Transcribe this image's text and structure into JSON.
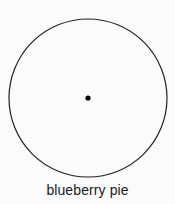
{
  "figure": {
    "caption": "blueberry pie",
    "background_color": "#fbfbfb",
    "stroke_color": "#222222",
    "fill_color": "#ffffff",
    "center_dot_color": "#000000"
  },
  "chart_data": {
    "type": "diagram",
    "title": "blueberry pie",
    "shape": "circle",
    "elements": [
      {
        "name": "circle-outline",
        "shape": "circle",
        "center_x": 88,
        "center_y": 98,
        "radius": 79,
        "stroke": "#222222",
        "stroke_width": 1.2,
        "fill": "none"
      },
      {
        "name": "center-point",
        "shape": "dot",
        "center_x": 88,
        "center_y": 98,
        "radius": 2.6,
        "fill": "#000000"
      }
    ],
    "labels": [
      {
        "text": "blueberry pie",
        "x": 88,
        "y": 196,
        "anchor": "middle"
      }
    ],
    "grid": false,
    "legend": null,
    "xlabel": "",
    "ylabel": ""
  }
}
